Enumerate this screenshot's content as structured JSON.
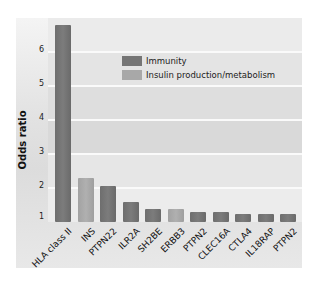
{
  "chart_data": {
    "type": "bar",
    "title": "",
    "xlabel": "",
    "ylabel": "Odds ratio",
    "ylim": [
      1,
      7
    ],
    "yticks": [
      1,
      2,
      3,
      4,
      5,
      6
    ],
    "grid": true,
    "legend_position": "upper right (inside plot)",
    "categories": [
      "HLA class II",
      "INS",
      "PTPN22",
      "ILR2A",
      "SH2BE",
      "ERBB3",
      "PTPN2",
      "CLEC16A",
      "CTLA4",
      "IL18RAP",
      "PTPN2"
    ],
    "values": [
      6.8,
      2.3,
      2.05,
      1.58,
      1.38,
      1.38,
      1.3,
      1.3,
      1.23,
      1.23,
      1.23
    ],
    "groups": [
      "Immunity",
      "Insulin production/metabolism",
      "Immunity",
      "Immunity",
      "Immunity",
      "Insulin production/metabolism",
      "Immunity",
      "Immunity",
      "Immunity",
      "Immunity",
      "Immunity"
    ],
    "legend": [
      {
        "name": "Immunity",
        "color": "#757575"
      },
      {
        "name": "Insulin production/metabolism",
        "color": "#a8a8a8"
      }
    ]
  },
  "axis": {
    "ylabel": "Odds ratio",
    "yticks": [
      "1",
      "2",
      "3",
      "4",
      "5",
      "6"
    ]
  },
  "legend": {
    "immunity": "Immunity",
    "insulin": "Insulin production/metabolism"
  }
}
